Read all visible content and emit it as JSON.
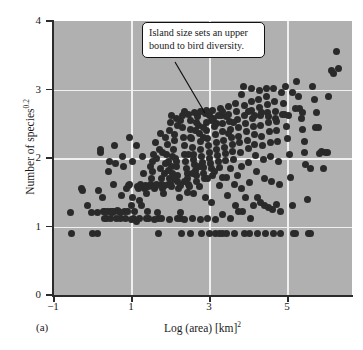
{
  "figure": {
    "panel_label": "(a)",
    "background_color": "#b0b0b0",
    "marker_color": "#2a2a2a",
    "gridline_color": "#f0f0f0",
    "axis_color": "#2b2b2b"
  },
  "annotation": {
    "text": "Island size sets an upper bound to bird diversity.",
    "line1": "Island size sets an upper",
    "line2": "bound to bird diversity.",
    "leader_from": [
      175,
      62
    ],
    "leader_to": [
      205,
      113
    ]
  },
  "axes": {
    "ytitle_main": "Number of species",
    "ytitle_exponent": "0.2",
    "xtitle_main": "Log (area) [km]",
    "xtitle_exponent": "2",
    "yticks": [
      "0",
      "1",
      "2",
      "3",
      "4"
    ],
    "xticks": [
      "−1",
      "1",
      "3",
      "5"
    ]
  },
  "chart_data": {
    "type": "scatter",
    "title": "",
    "xlabel": "Log (area) [km]^2",
    "ylabel": "Number of species^0.2",
    "xlim": [
      -1,
      6.85
    ],
    "ylim": [
      0,
      4
    ],
    "xticks": [
      -1,
      1,
      3,
      5
    ],
    "yticks": [
      0,
      1,
      2,
      3,
      4
    ],
    "grid": "white gridlines at x = 1, 3, 5 and y = 1, 2, 3",
    "legend": "none",
    "annotations": [
      {
        "text": "Island size sets an upper bound to bird diversity.",
        "x": 2.4,
        "y": 3.55
      }
    ],
    "n_points": 382,
    "points": [
      [
        -0.55,
        1.2
      ],
      [
        -0.52,
        0.9
      ],
      [
        -0.25,
        1.55
      ],
      [
        -0.22,
        1.52
      ],
      [
        -0.1,
        1.3
      ],
      [
        0.02,
        1.2
      ],
      [
        0.05,
        0.9
      ],
      [
        0.18,
        0.9
      ],
      [
        0.2,
        1.52
      ],
      [
        0.25,
        2.12
      ],
      [
        0.26,
        2.08
      ],
      [
        0.3,
        1.42
      ],
      [
        0.33,
        1.22
      ],
      [
        0.36,
        1.22
      ],
      [
        0.4,
        1.12
      ],
      [
        0.42,
        1.22
      ],
      [
        0.45,
        1.8
      ],
      [
        0.48,
        1.95
      ],
      [
        0.5,
        1.22
      ],
      [
        0.52,
        1.12
      ],
      [
        0.55,
        1.2
      ],
      [
        0.58,
        1.22
      ],
      [
        0.6,
        1.62
      ],
      [
        0.62,
        2.18
      ],
      [
        0.64,
        1.92
      ],
      [
        0.66,
        1.12
      ],
      [
        0.7,
        1.24
      ],
      [
        0.73,
        1.22
      ],
      [
        0.76,
        1.12
      ],
      [
        0.8,
        1.45
      ],
      [
        0.82,
        2.02
      ],
      [
        0.85,
        1.88
      ],
      [
        0.88,
        1.22
      ],
      [
        0.9,
        1.12
      ],
      [
        0.94,
        1.55
      ],
      [
        0.97,
        1.6
      ],
      [
        1.0,
        2.3
      ],
      [
        1.02,
        1.62
      ],
      [
        1.05,
        1.3
      ],
      [
        1.08,
        1.42
      ],
      [
        1.1,
        1.95
      ],
      [
        1.12,
        1.12
      ],
      [
        1.15,
        1.22
      ],
      [
        1.18,
        1.08
      ],
      [
        1.2,
        2.18
      ],
      [
        1.22,
        1.58
      ],
      [
        1.25,
        1.55
      ],
      [
        1.28,
        1.38
      ],
      [
        1.3,
        1.62
      ],
      [
        1.33,
        1.3
      ],
      [
        1.35,
        2.02
      ],
      [
        1.38,
        1.78
      ],
      [
        1.4,
        1.55
      ],
      [
        1.42,
        1.6
      ],
      [
        1.45,
        1.48
      ],
      [
        1.48,
        1.22
      ],
      [
        1.5,
        1.12
      ],
      [
        1.52,
        1.58
      ],
      [
        1.55,
        1.62
      ],
      [
        1.58,
        1.7
      ],
      [
        1.6,
        1.95
      ],
      [
        1.62,
        1.8
      ],
      [
        1.64,
        2.05
      ],
      [
        1.66,
        1.55
      ],
      [
        1.68,
        1.58
      ],
      [
        1.7,
        1.6
      ],
      [
        1.72,
        1.62
      ],
      [
        1.74,
        1.2
      ],
      [
        1.76,
        1.12
      ],
      [
        1.78,
        0.9
      ],
      [
        1.8,
        2.12
      ],
      [
        1.82,
        1.85
      ],
      [
        1.84,
        1.7
      ],
      [
        1.86,
        1.62
      ],
      [
        1.88,
        1.55
      ],
      [
        1.9,
        1.48
      ],
      [
        1.92,
        1.6
      ],
      [
        1.94,
        1.78
      ],
      [
        1.96,
        1.92
      ],
      [
        1.98,
        2.05
      ],
      [
        2.0,
        2.2
      ],
      [
        2.02,
        1.95
      ],
      [
        2.04,
        1.82
      ],
      [
        2.06,
        1.7
      ],
      [
        2.08,
        1.62
      ],
      [
        2.1,
        1.58
      ],
      [
        2.12,
        1.88
      ],
      [
        2.14,
        2.02
      ],
      [
        2.16,
        2.12
      ],
      [
        2.18,
        2.25
      ],
      [
        2.2,
        2.35
      ],
      [
        2.22,
        2.0
      ],
      [
        2.24,
        1.88
      ],
      [
        2.26,
        1.75
      ],
      [
        2.28,
        1.65
      ],
      [
        2.3,
        1.55
      ],
      [
        2.32,
        1.42
      ],
      [
        2.34,
        1.2
      ],
      [
        2.36,
        1.12
      ],
      [
        2.38,
        0.9
      ],
      [
        2.4,
        2.45
      ],
      [
        2.42,
        2.3
      ],
      [
        2.44,
        2.18
      ],
      [
        2.46,
        2.05
      ],
      [
        2.48,
        1.95
      ],
      [
        2.5,
        1.85
      ],
      [
        2.52,
        1.78
      ],
      [
        2.54,
        1.7
      ],
      [
        2.56,
        1.62
      ],
      [
        2.58,
        1.58
      ],
      [
        2.6,
        2.55
      ],
      [
        2.62,
        2.42
      ],
      [
        2.64,
        2.28
      ],
      [
        2.66,
        2.15
      ],
      [
        2.68,
        2.05
      ],
      [
        2.7,
        1.98
      ],
      [
        2.72,
        1.9
      ],
      [
        2.74,
        1.82
      ],
      [
        2.76,
        1.74
      ],
      [
        2.78,
        1.66
      ],
      [
        2.8,
        2.6
      ],
      [
        2.82,
        2.48
      ],
      [
        2.84,
        2.36
      ],
      [
        2.86,
        2.24
      ],
      [
        2.88,
        2.12
      ],
      [
        2.9,
        2.02
      ],
      [
        2.92,
        1.94
      ],
      [
        2.94,
        1.86
      ],
      [
        2.96,
        1.78
      ],
      [
        2.98,
        1.7
      ],
      [
        3.0,
        2.65
      ],
      [
        3.02,
        2.52
      ],
      [
        3.04,
        2.4
      ],
      [
        3.06,
        2.28
      ],
      [
        3.08,
        2.18
      ],
      [
        3.1,
        2.08
      ],
      [
        3.12,
        2.0
      ],
      [
        3.14,
        1.92
      ],
      [
        3.16,
        1.84
      ],
      [
        3.18,
        1.75
      ],
      [
        3.2,
        2.7
      ],
      [
        3.22,
        2.58
      ],
      [
        3.24,
        2.46
      ],
      [
        3.26,
        2.34
      ],
      [
        3.28,
        2.22
      ],
      [
        3.3,
        2.12
      ],
      [
        3.32,
        2.04
      ],
      [
        3.34,
        1.95
      ],
      [
        3.36,
        1.86
      ],
      [
        3.38,
        1.6
      ],
      [
        3.4,
        2.72
      ],
      [
        3.42,
        2.62
      ],
      [
        3.44,
        2.5
      ],
      [
        3.46,
        2.38
      ],
      [
        3.48,
        2.26
      ],
      [
        3.5,
        2.16
      ],
      [
        3.52,
        2.06
      ],
      [
        3.54,
        1.96
      ],
      [
        3.56,
        1.72
      ],
      [
        3.58,
        1.45
      ],
      [
        3.6,
        2.75
      ],
      [
        3.62,
        2.64
      ],
      [
        3.64,
        2.54
      ],
      [
        3.66,
        2.42
      ],
      [
        3.68,
        2.3
      ],
      [
        3.7,
        2.2
      ],
      [
        3.72,
        2.1
      ],
      [
        3.74,
        1.98
      ],
      [
        3.76,
        1.62
      ],
      [
        3.78,
        1.3
      ],
      [
        3.8,
        2.8
      ],
      [
        3.82,
        2.68
      ],
      [
        3.84,
        2.56
      ],
      [
        3.86,
        2.44
      ],
      [
        3.88,
        2.32
      ],
      [
        3.9,
        2.22
      ],
      [
        3.92,
        2.08
      ],
      [
        3.94,
        1.88
      ],
      [
        3.96,
        1.55
      ],
      [
        3.98,
        1.22
      ],
      [
        4.0,
        3.05
      ],
      [
        4.02,
        2.76
      ],
      [
        4.04,
        2.62
      ],
      [
        4.06,
        2.5
      ],
      [
        4.08,
        2.38
      ],
      [
        4.1,
        2.26
      ],
      [
        4.12,
        2.14
      ],
      [
        4.14,
        1.94
      ],
      [
        4.16,
        1.64
      ],
      [
        4.18,
        1.12
      ],
      [
        4.2,
        2.82
      ],
      [
        4.22,
        2.7
      ],
      [
        4.24,
        2.58
      ],
      [
        4.26,
        2.46
      ],
      [
        4.28,
        2.34
      ],
      [
        4.3,
        2.2
      ],
      [
        4.32,
        2.04
      ],
      [
        4.34,
        1.8
      ],
      [
        4.36,
        1.42
      ],
      [
        4.38,
        0.9
      ],
      [
        4.4,
        2.86
      ],
      [
        4.42,
        2.74
      ],
      [
        4.44,
        2.62
      ],
      [
        4.46,
        2.48
      ],
      [
        4.48,
        2.32
      ],
      [
        4.5,
        2.18
      ],
      [
        4.52,
        1.98
      ],
      [
        4.54,
        1.7
      ],
      [
        4.56,
        1.3
      ],
      [
        4.58,
        0.9
      ],
      [
        4.6,
        2.9
      ],
      [
        4.62,
        2.78
      ],
      [
        4.64,
        2.66
      ],
      [
        4.66,
        2.52
      ],
      [
        4.68,
        2.38
      ],
      [
        4.7,
        2.22
      ],
      [
        4.72,
        2.02
      ],
      [
        4.74,
        1.66
      ],
      [
        4.76,
        1.25
      ],
      [
        4.78,
        0.9
      ],
      [
        4.8,
        3.02
      ],
      [
        4.82,
        2.82
      ],
      [
        4.84,
        2.68
      ],
      [
        4.86,
        2.54
      ],
      [
        4.88,
        2.4
      ],
      [
        4.9,
        2.24
      ],
      [
        4.92,
        1.95
      ],
      [
        4.94,
        1.62
      ],
      [
        4.96,
        1.22
      ],
      [
        4.98,
        0.9
      ],
      [
        5.0,
        2.96
      ],
      [
        5.04,
        2.8
      ],
      [
        5.08,
        2.64
      ],
      [
        5.12,
        2.46
      ],
      [
        5.16,
        2.28
      ],
      [
        5.2,
        2.05
      ],
      [
        5.24,
        1.72
      ],
      [
        5.28,
        1.3
      ],
      [
        5.32,
        0.9
      ],
      [
        5.36,
        0.9
      ],
      [
        5.4,
        3.12
      ],
      [
        5.44,
        2.9
      ],
      [
        5.48,
        2.72
      ],
      [
        5.52,
        2.58
      ],
      [
        5.56,
        2.42
      ],
      [
        5.6,
        2.24
      ],
      [
        5.64,
        1.9
      ],
      [
        5.68,
        1.4
      ],
      [
        5.72,
        0.9
      ],
      [
        5.76,
        0.9
      ],
      [
        5.8,
        3.05
      ],
      [
        5.86,
        2.86
      ],
      [
        5.92,
        2.66
      ],
      [
        5.98,
        2.44
      ],
      [
        6.04,
        2.1
      ],
      [
        6.1,
        1.84
      ],
      [
        6.16,
        2.08
      ],
      [
        6.22,
        2.9
      ],
      [
        6.3,
        3.28
      ],
      [
        6.36,
        3.24
      ],
      [
        6.44,
        3.55
      ],
      [
        6.5,
        3.3
      ],
      [
        1.95,
        2.3
      ],
      [
        2.05,
        2.4
      ],
      [
        2.15,
        1.78
      ],
      [
        2.25,
        1.95
      ],
      [
        2.35,
        2.55
      ],
      [
        2.45,
        1.66
      ],
      [
        2.55,
        2.05
      ],
      [
        2.65,
        1.78
      ],
      [
        2.75,
        2.4
      ],
      [
        2.85,
        1.88
      ],
      [
        2.95,
        2.45
      ],
      [
        3.05,
        1.7
      ],
      [
        3.15,
        2.55
      ],
      [
        3.25,
        1.8
      ],
      [
        3.35,
        2.62
      ],
      [
        3.45,
        1.72
      ],
      [
        3.55,
        2.6
      ],
      [
        3.65,
        1.85
      ],
      [
        3.75,
        2.52
      ],
      [
        3.85,
        1.75
      ],
      [
        2.12,
        2.62
      ],
      [
        2.28,
        2.48
      ],
      [
        2.44,
        2.68
      ],
      [
        2.62,
        2.3
      ],
      [
        2.78,
        2.52
      ],
      [
        2.94,
        2.3
      ],
      [
        3.12,
        2.62
      ],
      [
        3.28,
        2.5
      ],
      [
        3.44,
        2.68
      ],
      [
        3.62,
        2.36
      ],
      [
        1.68,
        2.22
      ],
      [
        1.82,
        2.36
      ],
      [
        2.04,
        1.62
      ],
      [
        2.2,
        1.68
      ],
      [
        2.36,
        1.6
      ],
      [
        2.52,
        1.5
      ],
      [
        2.68,
        1.48
      ],
      [
        2.84,
        1.58
      ],
      [
        3.0,
        1.42
      ],
      [
        3.16,
        1.35
      ],
      [
        1.55,
        1.88
      ],
      [
        1.72,
        2.0
      ],
      [
        1.88,
        2.08
      ],
      [
        2.08,
        2.52
      ],
      [
        2.24,
        2.58
      ],
      [
        2.4,
        2.62
      ],
      [
        2.56,
        2.64
      ],
      [
        2.72,
        2.66
      ],
      [
        2.88,
        2.68
      ],
      [
        3.04,
        2.7
      ],
      [
        3.96,
        2.92
      ],
      [
        4.12,
        2.68
      ],
      [
        4.3,
        2.62
      ],
      [
        4.48,
        2.66
      ],
      [
        4.66,
        2.6
      ],
      [
        4.84,
        2.58
      ],
      [
        5.02,
        2.64
      ],
      [
        5.18,
        2.62
      ],
      [
        5.36,
        2.72
      ],
      [
        5.54,
        2.66
      ],
      [
        4.06,
        1.42
      ],
      [
        4.26,
        1.3
      ],
      [
        4.46,
        1.35
      ],
      [
        4.66,
        1.28
      ],
      [
        4.86,
        1.32
      ],
      [
        3.86,
        1.22
      ],
      [
        3.66,
        1.12
      ],
      [
        3.46,
        1.18
      ],
      [
        3.26,
        1.1
      ],
      [
        3.06,
        1.12
      ],
      [
        2.86,
        1.1
      ],
      [
        2.66,
        1.12
      ],
      [
        2.46,
        1.1
      ],
      [
        2.26,
        1.12
      ],
      [
        2.06,
        1.1
      ],
      [
        1.86,
        1.12
      ],
      [
        1.66,
        1.1
      ],
      [
        1.46,
        1.12
      ],
      [
        1.26,
        1.12
      ],
      [
        1.06,
        1.1
      ],
      [
        0.96,
        1.22
      ],
      [
        0.76,
        1.2
      ],
      [
        0.56,
        1.22
      ],
      [
        0.36,
        1.12
      ],
      [
        0.16,
        1.2
      ],
      [
        2.9,
        0.9
      ],
      [
        3.1,
        0.9
      ],
      [
        3.26,
        0.9
      ],
      [
        3.36,
        0.9
      ],
      [
        3.46,
        0.9
      ],
      [
        3.56,
        0.9
      ],
      [
        3.76,
        0.9
      ],
      [
        4.04,
        0.9
      ],
      [
        4.16,
        0.9
      ],
      [
        2.6,
        0.9
      ],
      [
        5.6,
        2.08
      ],
      [
        5.76,
        1.84
      ],
      [
        6.0,
        2.06
      ],
      [
        6.2,
        2.08
      ],
      [
        5.9,
        2.44
      ],
      [
        4.2,
        3.02
      ],
      [
        4.42,
        2.98
      ],
      [
        4.6,
        3.02
      ],
      [
        5.1,
        3.04
      ],
      [
        5.3,
        2.96
      ]
    ]
  }
}
